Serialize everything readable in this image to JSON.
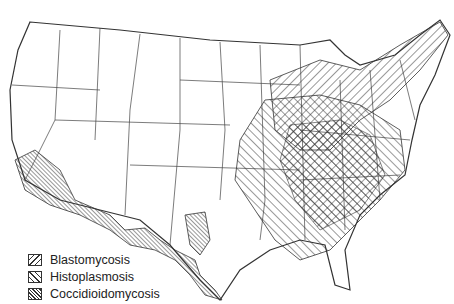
{
  "map": {
    "subject": "United States endemic regions of fungal diseases",
    "legend": [
      {
        "label": "Blastomycosis",
        "pattern": "diagonal-forward"
      },
      {
        "label": "Histoplasmosis",
        "pattern": "diagonal-backward"
      },
      {
        "label": "Coccidioidomycosis",
        "pattern": "dense-diagonal"
      }
    ]
  }
}
